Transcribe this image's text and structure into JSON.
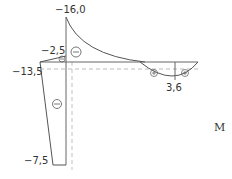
{
  "diagram": {
    "type": "bending-moment-diagram",
    "title_symbol": "M",
    "values": {
      "beam_peak": "−16,0",
      "joint_top": "−2,5",
      "joint_left": "−13,5",
      "column_bottom": "−7,5",
      "span_max": "3,6"
    },
    "signs": {
      "beam_left": "minus",
      "joint": "minus",
      "column": "minus",
      "span_left": "plus",
      "span_right": "plus"
    },
    "colors": {
      "line": "#555555",
      "dashed": "#bbbbbb"
    }
  }
}
